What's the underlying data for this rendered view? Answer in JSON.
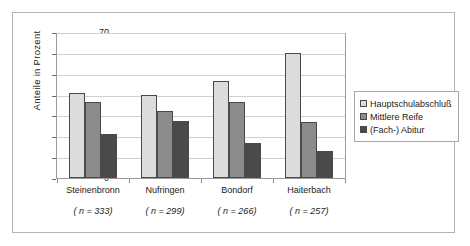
{
  "chart_data": {
    "type": "bar",
    "title": "",
    "subtitle": "",
    "xlabel": "",
    "ylabel": "Anteile in Prozent",
    "ylim": [
      0,
      70
    ],
    "ytick_step": 10,
    "yticks": [
      70,
      60,
      50,
      40,
      30,
      20,
      10,
      0
    ],
    "grid": true,
    "legend_position": "right",
    "categories": [
      "Steinenbronn",
      "Nufringen",
      "Bondorf",
      "Haiterbach"
    ],
    "category_annotations": [
      "( n = 333)",
      "( n = 299)",
      "( n = 266)",
      "( n = 257)"
    ],
    "series": [
      {
        "name": "Hauptschulabschluß",
        "color": "#dcdcdc",
        "values": [
          41.5,
          40.5,
          47.0,
          61.0
        ]
      },
      {
        "name": "Mittlere Reife",
        "color": "#8c8c8c",
        "values": [
          37.0,
          32.5,
          37.0,
          27.0
        ]
      },
      {
        "name": "(Fach-) Abitur",
        "color": "#4a4a4a",
        "values": [
          21.5,
          27.5,
          17.0,
          13.0
        ]
      }
    ]
  },
  "figure": {
    "frame_color": "#b4b4b4",
    "plot_border_color": "#9a9a9a",
    "gridline_color": "#d0d0d0",
    "background": "#ffffff"
  }
}
